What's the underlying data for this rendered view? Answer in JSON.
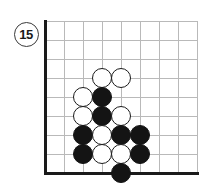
{
  "diagram": {
    "kind": "go-board-problem-diagram",
    "move_number_label": "15",
    "board": {
      "columns": 8,
      "rows": 8,
      "origin_x": 45,
      "origin_y": 21,
      "spacing": 19,
      "grid_color": "#b9b9b9",
      "edge_color": "#1a1a1a",
      "background_color": "#ffffff",
      "left_edge_thick": true,
      "bottom_edge_thick": true
    },
    "badge": {
      "label": "15",
      "center_x": 26,
      "center_y": 34,
      "diameter": 25,
      "ring_color": "#3a3a3a",
      "text_color": "#1a1a1a",
      "fill_color": "#ffffff"
    },
    "stone_diameter": 20,
    "stones": [
      {
        "id": "w1",
        "color": "white",
        "col": 3,
        "row": 3
      },
      {
        "id": "w2",
        "color": "white",
        "col": 4,
        "row": 3
      },
      {
        "id": "w3",
        "color": "white",
        "col": 2,
        "row": 4
      },
      {
        "id": "b1",
        "color": "black",
        "col": 3,
        "row": 4
      },
      {
        "id": "w4",
        "color": "white",
        "col": 2,
        "row": 5
      },
      {
        "id": "b2",
        "color": "black",
        "col": 3,
        "row": 5
      },
      {
        "id": "w5",
        "color": "white",
        "col": 4,
        "row": 5
      },
      {
        "id": "b3",
        "color": "black",
        "col": 2,
        "row": 6
      },
      {
        "id": "w6",
        "color": "white",
        "col": 3,
        "row": 6
      },
      {
        "id": "b4",
        "color": "black",
        "col": 4,
        "row": 6
      },
      {
        "id": "b5",
        "color": "black",
        "col": 5,
        "row": 6
      },
      {
        "id": "b6",
        "color": "black",
        "col": 2,
        "row": 7
      },
      {
        "id": "w7",
        "color": "white",
        "col": 3,
        "row": 7
      },
      {
        "id": "w8",
        "color": "white",
        "col": 4,
        "row": 7
      },
      {
        "id": "b7",
        "color": "black",
        "col": 5,
        "row": 7
      },
      {
        "id": "b8",
        "color": "black",
        "col": 4,
        "row": 8
      }
    ],
    "colors": {
      "black_stone": "#141414",
      "white_stone_fill": "#ffffff",
      "white_stone_border": "#1a1a1a"
    }
  }
}
